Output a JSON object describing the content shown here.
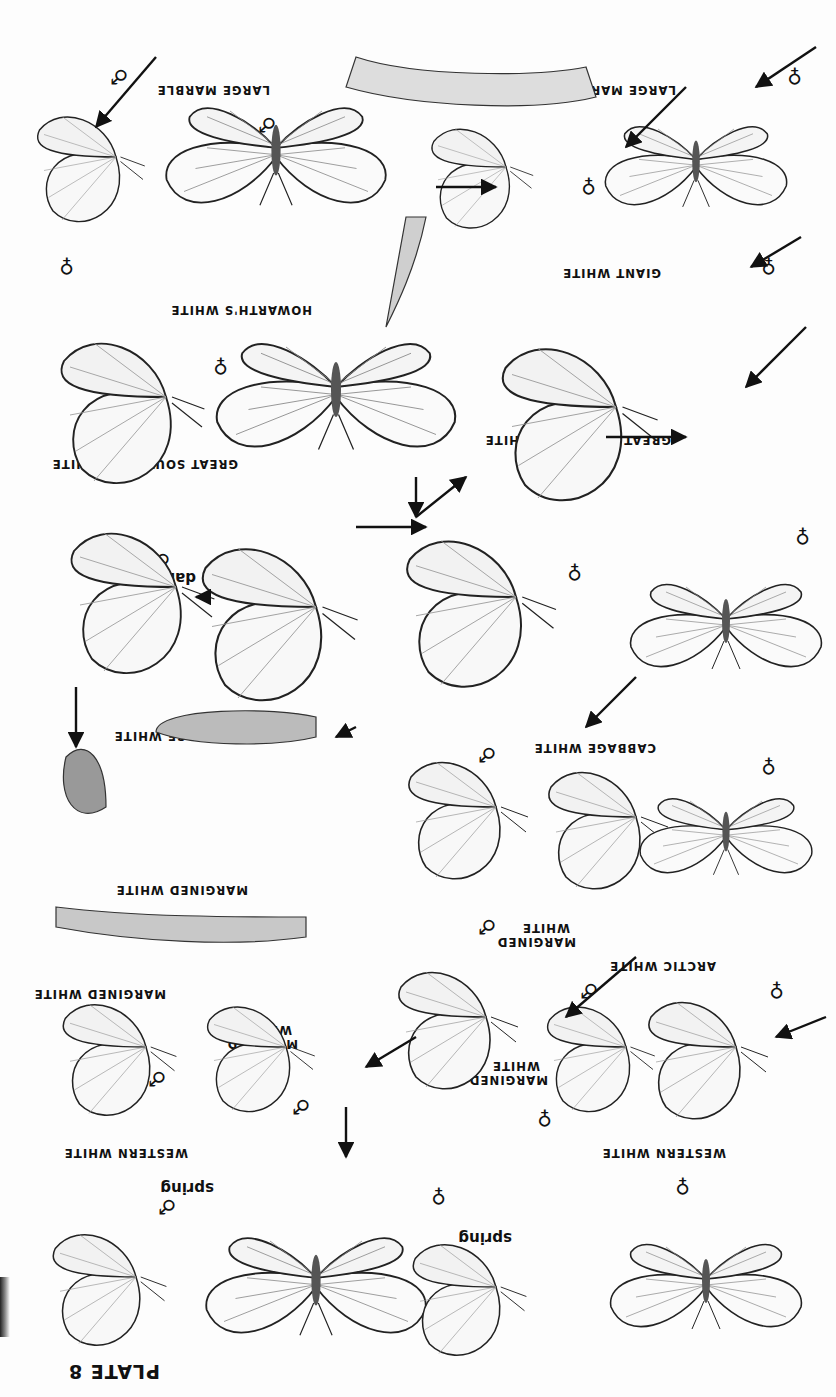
{
  "plate": {
    "title": "PLATE 8",
    "orientation": "rotated 180 degrees (upside down)",
    "background": "#fdfdfd",
    "ink": "#111111"
  },
  "labels": [
    {
      "id": "large-marble-1",
      "text": "LARGE MARBLE"
    },
    {
      "id": "large-marble-2",
      "text": "LARGE MARBLE"
    },
    {
      "id": "howarths-white",
      "text": "HOWARTH'S WHITE"
    },
    {
      "id": "giant-white",
      "text": "GIANT WHITE"
    },
    {
      "id": "great-southern-white-1",
      "text": "GREAT SOUTHERN WHITE"
    },
    {
      "id": "great-southern-white-2",
      "text": "GREAT SOUTHERN WHITE"
    },
    {
      "id": "cabbage-white-1",
      "text": "CABBAGE WHITE"
    },
    {
      "id": "cabbage-white-2",
      "text": "CABBAGE WHITE"
    },
    {
      "id": "margined-white-1",
      "text": "MARGINED WHITE"
    },
    {
      "id": "margined-white-2",
      "text": "MARGINED WHITE"
    },
    {
      "id": "margined-white-3",
      "text": "MARGINED WHITE"
    },
    {
      "id": "margined-white-4",
      "text": "MARGINED WHITE"
    },
    {
      "id": "mustard-white",
      "text": "MUSTARD WHITE"
    },
    {
      "id": "arctic-white",
      "text": "ARCTIC WHITE"
    },
    {
      "id": "western-white-1",
      "text": "WESTERN WHITE"
    },
    {
      "id": "western-white-2",
      "text": "WESTERN WHITE"
    }
  ],
  "notes": {
    "dark": "dark",
    "spring_1": "spring",
    "spring_2": "spring"
  },
  "symbols": {
    "male": "♂",
    "female": "♀"
  }
}
